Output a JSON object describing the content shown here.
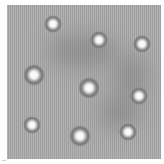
{
  "image": {
    "description": "Grayscale micrograph-style image of bright circular spots with dark halos on a gray striped background",
    "background_color": "#a9a9a9",
    "border_color": "#ffffff",
    "spots": [
      {
        "x": 53,
        "y": 24,
        "size": "normal"
      },
      {
        "x": 99,
        "y": 40,
        "size": "normal"
      },
      {
        "x": 142,
        "y": 44,
        "size": "normal"
      },
      {
        "x": 34,
        "y": 75,
        "size": "large"
      },
      {
        "x": 89,
        "y": 88,
        "size": "large"
      },
      {
        "x": 139,
        "y": 96,
        "size": "normal"
      },
      {
        "x": 32,
        "y": 125,
        "size": "normal"
      },
      {
        "x": 80,
        "y": 136,
        "size": "large"
      },
      {
        "x": 128,
        "y": 132,
        "size": "normal"
      }
    ],
    "shadow_regions": [
      {
        "x": 70,
        "y": 50,
        "w": 60,
        "h": 30
      },
      {
        "x": 105,
        "y": 100,
        "w": 40,
        "h": 30
      },
      {
        "x": 120,
        "y": 60,
        "w": 30,
        "h": 40
      }
    ]
  }
}
